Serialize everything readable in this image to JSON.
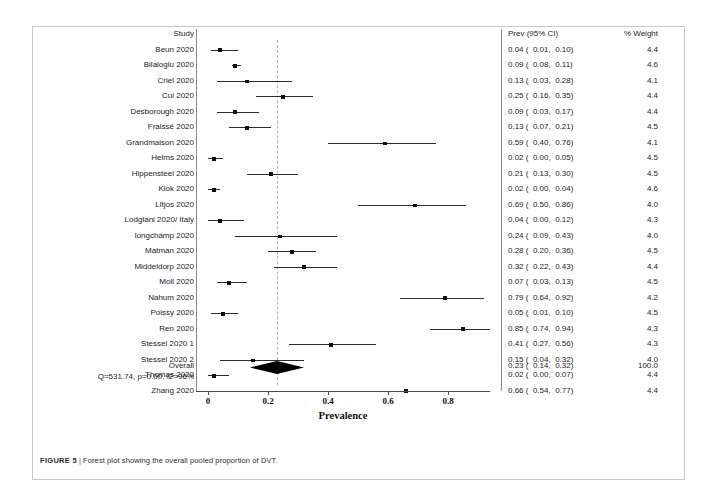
{
  "figure": {
    "caption_label": "FIGURE 5",
    "caption_separator": "|",
    "caption_text": "Forest plot showing the overall pooled proportion of DVT."
  },
  "headers": {
    "study": "Study",
    "prev": "Prev (95% CI)",
    "weight": "% Weight"
  },
  "overall": {
    "label": "Overall",
    "heterogeneity": "Q=531.74, p=0.00, I2=96%",
    "prev": "0.23 (  0.14,  0.32)",
    "weight": "100.0"
  },
  "chart_data": {
    "type": "forest",
    "title": "Forest plot showing the overall pooled proportion of DVT.",
    "xlabel": "Prevalence",
    "ylabel": "",
    "xlim": [
      0,
      1.0
    ],
    "xticks": [
      0,
      0.2,
      0.4,
      0.6,
      0.8
    ],
    "xtick_labels": [
      "0",
      "0.2",
      "0.4",
      "0.6",
      "0.8"
    ],
    "grid": false,
    "reference_line": 0.23,
    "effect_measure": "Prevalence",
    "columns": [
      "Study",
      "Prev (95% CI)",
      "% Weight"
    ],
    "pooled": {
      "label": "Overall",
      "estimate": 0.23,
      "ci_low": 0.14,
      "ci_high": 0.32,
      "weight": 100.0,
      "prev_text": "0.23 (  0.14,  0.32)",
      "weight_text": "100.0",
      "Q": 531.74,
      "p": 0.0,
      "I2": 96
    },
    "studies": [
      {
        "label": "Beun 2020",
        "estimate": 0.04,
        "ci_low": 0.01,
        "ci_high": 0.1,
        "weight": 4.4,
        "prev_text": "0.04 (  0.01,  0.10)",
        "weight_text": "4.4"
      },
      {
        "label": "Bilaloglu 2020",
        "estimate": 0.09,
        "ci_low": 0.08,
        "ci_high": 0.11,
        "weight": 4.6,
        "prev_text": "0.09 (  0.08,  0.11)",
        "weight_text": "4.6"
      },
      {
        "label": "Criel 2020",
        "estimate": 0.13,
        "ci_low": 0.03,
        "ci_high": 0.28,
        "weight": 4.1,
        "prev_text": "0.13 (  0.03,  0.28)",
        "weight_text": "4.1"
      },
      {
        "label": "Cui 2020",
        "estimate": 0.25,
        "ci_low": 0.16,
        "ci_high": 0.35,
        "weight": 4.4,
        "prev_text": "0.25 (  0.16,  0.35)",
        "weight_text": "4.4"
      },
      {
        "label": "Desborough 2020",
        "estimate": 0.09,
        "ci_low": 0.03,
        "ci_high": 0.17,
        "weight": 4.4,
        "prev_text": "0.09 (  0.03,  0.17)",
        "weight_text": "4.4"
      },
      {
        "label": "Fraissé 2020",
        "estimate": 0.13,
        "ci_low": 0.07,
        "ci_high": 0.21,
        "weight": 4.5,
        "prev_text": "0.13 (  0.07,  0.21)",
        "weight_text": "4.5"
      },
      {
        "label": "Grandmaison 2020",
        "estimate": 0.59,
        "ci_low": 0.4,
        "ci_high": 0.76,
        "weight": 4.1,
        "prev_text": "0.59 (  0.40,  0.76)",
        "weight_text": "4.1"
      },
      {
        "label": "Helms 2020",
        "estimate": 0.02,
        "ci_low": 0.0,
        "ci_high": 0.05,
        "weight": 4.5,
        "prev_text": "0.02 (  0.00,  0.05)",
        "weight_text": "4.5"
      },
      {
        "label": "Hippensteel 2020",
        "estimate": 0.21,
        "ci_low": 0.13,
        "ci_high": 0.3,
        "weight": 4.5,
        "prev_text": "0.21 (  0.13,  0.30)",
        "weight_text": "4.5"
      },
      {
        "label": "Klok 2020",
        "estimate": 0.02,
        "ci_low": 0.0,
        "ci_high": 0.04,
        "weight": 4.6,
        "prev_text": "0.02 (  0.00,  0.04)",
        "weight_text": "4.6"
      },
      {
        "label": "Lltjos 2020",
        "estimate": 0.69,
        "ci_low": 0.5,
        "ci_high": 0.86,
        "weight": 4.0,
        "prev_text": "0.69 (  0.50,  0.86)",
        "weight_text": "4.0"
      },
      {
        "label": "Lodglani 2020/ Italy",
        "estimate": 0.04,
        "ci_low": 0.0,
        "ci_high": 0.12,
        "weight": 4.3,
        "prev_text": "0.04 (  0.00,  0.12)",
        "weight_text": "4.3"
      },
      {
        "label": "longchamp 2020",
        "estimate": 0.24,
        "ci_low": 0.09,
        "ci_high": 0.43,
        "weight": 4.0,
        "prev_text": "0.24 (  0.09,  0.43)",
        "weight_text": "4.0"
      },
      {
        "label": "Matman 2020",
        "estimate": 0.28,
        "ci_low": 0.2,
        "ci_high": 0.36,
        "weight": 4.5,
        "prev_text": "0.28 (  0.20,  0.36)",
        "weight_text": "4.5"
      },
      {
        "label": "Middeldorp 2020",
        "estimate": 0.32,
        "ci_low": 0.22,
        "ci_high": 0.43,
        "weight": 4.4,
        "prev_text": "0.32 (  0.22,  0.43)",
        "weight_text": "4.4"
      },
      {
        "label": "Moll 2020",
        "estimate": 0.07,
        "ci_low": 0.03,
        "ci_high": 0.13,
        "weight": 4.5,
        "prev_text": "0.07 (  0.03,  0.13)",
        "weight_text": "4.5"
      },
      {
        "label": "Nahum 2020",
        "estimate": 0.79,
        "ci_low": 0.64,
        "ci_high": 0.92,
        "weight": 4.2,
        "prev_text": "0.79 (  0.64,  0.92)",
        "weight_text": "4.2"
      },
      {
        "label": "Poissy 2020",
        "estimate": 0.05,
        "ci_low": 0.01,
        "ci_high": 0.1,
        "weight": 4.5,
        "prev_text": "0.05 (  0.01,  0.10)",
        "weight_text": "4.5"
      },
      {
        "label": "Ren 2020",
        "estimate": 0.85,
        "ci_low": 0.74,
        "ci_high": 0.94,
        "weight": 4.3,
        "prev_text": "0.85 (  0.74,  0.94)",
        "weight_text": "4.3"
      },
      {
        "label": "Stessel 2020 1",
        "estimate": 0.41,
        "ci_low": 0.27,
        "ci_high": 0.56,
        "weight": 4.3,
        "prev_text": "0.41 (  0.27,  0.56)",
        "weight_text": "4.3"
      },
      {
        "label": "Stessel 2020 2",
        "estimate": 0.15,
        "ci_low": 0.04,
        "ci_high": 0.32,
        "weight": 4.0,
        "prev_text": "0.15 (  0.04,  0.32)",
        "weight_text": "4.0"
      },
      {
        "label": "Thomas 2020",
        "estimate": 0.02,
        "ci_low": 0.0,
        "ci_high": 0.07,
        "weight": 4.4,
        "prev_text": "0.02 (  0.00,  0.07)",
        "weight_text": "4.4"
      },
      {
        "label": "Zhang 2020",
        "estimate": 0.66,
        "ci_low": 0.54,
        "ci_high": 0.77,
        "weight": 4.4,
        "prev_text": "0.66 (  0.54,  0.77)",
        "weight_text": "4.4"
      }
    ]
  }
}
